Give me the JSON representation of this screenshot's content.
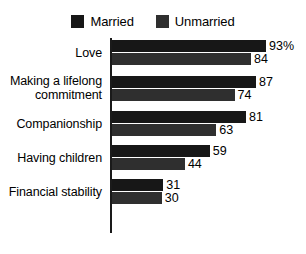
{
  "chart_data": {
    "type": "bar",
    "orientation": "horizontal",
    "title": "",
    "xlabel": "",
    "ylabel": "",
    "xlim": [
      0,
      100
    ],
    "grid": false,
    "legend_position": "top-center",
    "categories": [
      "Love",
      "Making a lifelong commitment",
      "Companionship",
      "Having children",
      "Financial stability"
    ],
    "series": [
      {
        "name": "Married",
        "color": "#171717",
        "values": [
          93,
          87,
          81,
          59,
          31
        ],
        "value_labels": [
          "93%",
          "87",
          "81",
          "59",
          "31"
        ]
      },
      {
        "name": "Unmarried",
        "color": "#2f2f2f",
        "values": [
          84,
          74,
          63,
          44,
          30
        ],
        "value_labels": [
          "84",
          "74",
          "63",
          "44",
          "30"
        ]
      }
    ]
  },
  "legend": {
    "entries": [
      {
        "label": "Married",
        "swatch": "legend-swatch-married"
      },
      {
        "label": "Unmarried",
        "swatch": "legend-swatch-unmarried"
      }
    ]
  },
  "rows": [
    {
      "category_line1": "Love",
      "category_line2": "",
      "married_label": "93%",
      "unmarried_label": "84"
    },
    {
      "category_line1": "Making a lifelong",
      "category_line2": "commitment",
      "married_label": "87",
      "unmarried_label": "74"
    },
    {
      "category_line1": "Companionship",
      "category_line2": "",
      "married_label": "81",
      "unmarried_label": "63"
    },
    {
      "category_line1": "Having children",
      "category_line2": "",
      "married_label": "59",
      "unmarried_label": "44"
    },
    {
      "category_line1": "Financial stability",
      "category_line2": "",
      "married_label": "31",
      "unmarried_label": "30"
    }
  ]
}
